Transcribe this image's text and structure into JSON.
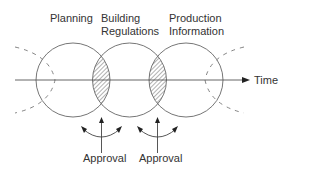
{
  "labels": {
    "planning": "Planning",
    "building_1": "Building",
    "building_2": "Regulations",
    "production_1": "Production",
    "production_2": "Information",
    "time": "Time",
    "approval_1": "Approval",
    "approval_2": "Approval"
  },
  "colors": {
    "line": "#555555",
    "text": "#333333"
  }
}
